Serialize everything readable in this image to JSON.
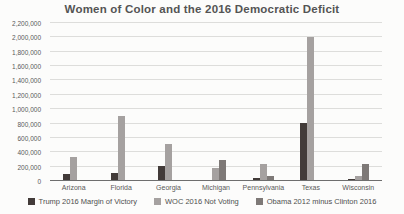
{
  "chart_data": {
    "type": "bar",
    "title": "Women of Color and the 2016 Democratic Deficit",
    "categories": [
      "Arizona",
      "Florida",
      "Georgia",
      "Michigan",
      "Pennsylvania",
      "Texas",
      "Wisconsin"
    ],
    "series": [
      {
        "name": "Trump 2016 Margin of Victory",
        "color": "#423b39",
        "values": [
          91000,
          113000,
          211000,
          11000,
          44000,
          810000,
          23000
        ]
      },
      {
        "name": "WOC 2016 Not Voting",
        "color": "#a5a1a0",
        "values": [
          330000,
          900000,
          520000,
          180000,
          240000,
          2000000,
          70000
        ]
      },
      {
        "name": "Obama 2012 minus Clinton 2016",
        "color": "#7e7977",
        "values": [
          0,
          0,
          0,
          290000,
          65000,
          0,
          230000
        ]
      }
    ],
    "xlabel": "",
    "ylabel": "",
    "ylim": [
      0,
      2200000
    ],
    "ytick_step": 200000,
    "grid": true,
    "legend_position": "bottom",
    "colors": {
      "background": "#fcfcfb",
      "gridline": "#dddddb",
      "axis_line": "#6e6e6e",
      "title_text": "#545454",
      "tick_text": "#595959",
      "legend_text": "#4f4f4f"
    }
  }
}
